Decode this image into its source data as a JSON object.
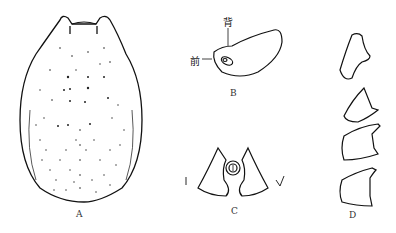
{
  "figure": {
    "panels": [
      {
        "id": "A",
        "label": "A",
        "description": "dorsal view of body, oval scutum with dotted punctations"
      },
      {
        "id": "B",
        "label": "B",
        "description": "lateral view with spiracle",
        "annotations": [
          {
            "text": "背",
            "meaning": "dorsal"
          },
          {
            "text": "前",
            "meaning": "anterior"
          }
        ]
      },
      {
        "id": "C",
        "label": "C",
        "description": "genital / anal region plates"
      },
      {
        "id": "D",
        "label": "D",
        "description": "series of four claw/tarsal segments"
      }
    ]
  }
}
